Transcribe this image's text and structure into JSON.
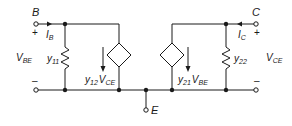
{
  "diagram": {
    "type": "y-parameter equivalent circuit",
    "terminals": {
      "base": "B",
      "collector": "C",
      "emitter": "E"
    },
    "left_port": {
      "voltage": {
        "main": "V",
        "sub": "BE"
      },
      "plus": "+",
      "minus": "–",
      "current": {
        "main": "I",
        "sub": "B"
      },
      "admittance": {
        "main": "y",
        "sub": "11"
      },
      "dependent_source": {
        "coef_main": "y",
        "coef_sub": "12",
        "var_main": "V",
        "var_sub": "CE"
      }
    },
    "right_port": {
      "voltage": {
        "main": "V",
        "sub": "CE"
      },
      "plus": "+",
      "minus": "–",
      "current": {
        "main": "I",
        "sub": "C"
      },
      "admittance": {
        "main": "y",
        "sub": "22"
      },
      "dependent_source": {
        "coef_main": "y",
        "coef_sub": "21",
        "var_main": "V",
        "var_sub": "BE"
      }
    },
    "colors": {
      "wire": "#1a1a1a",
      "background": "#ffffff"
    }
  }
}
